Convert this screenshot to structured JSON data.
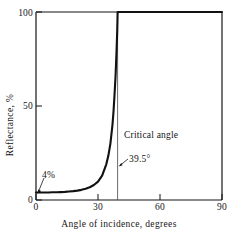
{
  "chart_data": {
    "type": "line",
    "title": "",
    "subtitle": "",
    "xlabel": "Angle of incidence, degrees",
    "ylabel": "Reflectance, %",
    "xlim": [
      0,
      90
    ],
    "ylim": [
      0,
      100
    ],
    "xticks": [
      0,
      30,
      60,
      90
    ],
    "xtick_labels": [
      "0",
      "30",
      "60",
      "90"
    ],
    "yticks": [
      0,
      50,
      100
    ],
    "ytick_labels": [
      "0",
      "50",
      "100"
    ],
    "grid": false,
    "legend": null,
    "series": [
      {
        "name": "Reflectance vs angle of incidence",
        "x": [
          0,
          2,
          4,
          6,
          8,
          10,
          12,
          14,
          16,
          18,
          20,
          22,
          24,
          26,
          28,
          30,
          32,
          34,
          35,
          36,
          37,
          37.5,
          38,
          38.5,
          39,
          39.3,
          39.5,
          45,
          50,
          55,
          60,
          65,
          70,
          75,
          80,
          85,
          90
        ],
        "y": [
          4,
          4,
          4,
          4,
          4.1,
          4.1,
          4.2,
          4.3,
          4.5,
          4.7,
          5,
          5.4,
          6,
          6.8,
          8,
          9.8,
          13,
          19,
          23.5,
          30,
          40,
          47,
          56,
          66,
          80,
          90,
          100,
          100,
          100,
          100,
          100,
          100,
          100,
          100,
          100,
          100,
          100
        ]
      }
    ],
    "annotations": [
      {
        "id": "critical-angle-label",
        "text": "Critical angle",
        "x": 41.5,
        "y": 33
      },
      {
        "id": "critical-angle-value",
        "text": "39.5°",
        "x": 44,
        "y": 21
      },
      {
        "id": "four-percent-label",
        "text": "4%",
        "x": 8,
        "y": 15
      }
    ],
    "reference_lines": [
      {
        "id": "critical-angle-line",
        "orientation": "vertical",
        "x": 39.5,
        "y_from": 0,
        "y_to": 100
      }
    ]
  },
  "labels": {
    "x_title": "Angle of incidence, degrees",
    "y_title": "Reflectance, %",
    "x_ticks": [
      "0",
      "30",
      "60",
      "90"
    ],
    "y_ticks": [
      "0",
      "50",
      "100"
    ],
    "annotation_critical_angle": "Critical angle",
    "annotation_critical_value": "39.5°",
    "annotation_four_percent": "4%"
  },
  "colors": {
    "background": "#ffffff",
    "axis": "#151515",
    "curve": "#111111",
    "text": "#151515",
    "reference_line": "#444444"
  }
}
